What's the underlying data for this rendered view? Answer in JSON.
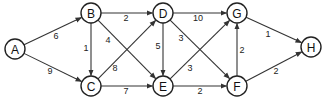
{
  "diagram": {
    "type": "weighted-directed-graph",
    "node_radius": 10,
    "colors": {
      "stroke": "#222222",
      "fill": "#ffffff",
      "text": "#111111"
    },
    "nodes": [
      {
        "id": "A",
        "label": "A",
        "x": 15,
        "y": 49
      },
      {
        "id": "B",
        "label": "B",
        "x": 91,
        "y": 13
      },
      {
        "id": "C",
        "label": "C",
        "x": 91,
        "y": 86
      },
      {
        "id": "D",
        "label": "D",
        "x": 163,
        "y": 13
      },
      {
        "id": "E",
        "label": "E",
        "x": 163,
        "y": 86
      },
      {
        "id": "G",
        "label": "G",
        "x": 237,
        "y": 13
      },
      {
        "id": "F",
        "label": "F",
        "x": 237,
        "y": 86
      },
      {
        "id": "H",
        "label": "H",
        "x": 311,
        "y": 47
      }
    ],
    "edges": [
      {
        "from": "A",
        "to": "B",
        "weight": "6",
        "lx": 56,
        "ly": 36
      },
      {
        "from": "A",
        "to": "C",
        "weight": "9",
        "lx": 50,
        "ly": 71
      },
      {
        "from": "B",
        "to": "D",
        "weight": "2",
        "lx": 126,
        "ly": 18
      },
      {
        "from": "B",
        "to": "C",
        "weight": "1",
        "lx": 86,
        "ly": 48
      },
      {
        "from": "B",
        "to": "E",
        "weight": "4",
        "lx": 108,
        "ly": 40
      },
      {
        "from": "C",
        "to": "D",
        "weight": "8",
        "lx": 115,
        "ly": 68
      },
      {
        "from": "C",
        "to": "E",
        "weight": "7",
        "lx": 126,
        "ly": 91
      },
      {
        "from": "D",
        "to": "E",
        "weight": "5",
        "lx": 158,
        "ly": 46
      },
      {
        "from": "D",
        "to": "G",
        "weight": "10",
        "lx": 198,
        "ly": 18
      },
      {
        "from": "D",
        "to": "F",
        "weight": "3",
        "lx": 181,
        "ly": 38
      },
      {
        "from": "E",
        "to": "G",
        "weight": "3",
        "lx": 190,
        "ly": 68
      },
      {
        "from": "E",
        "to": "F",
        "weight": "2",
        "lx": 200,
        "ly": 91
      },
      {
        "from": "F",
        "to": "G",
        "weight": "2",
        "lx": 242,
        "ly": 50
      },
      {
        "from": "G",
        "to": "H",
        "weight": "1",
        "lx": 268,
        "ly": 34
      },
      {
        "from": "F",
        "to": "H",
        "weight": "2",
        "lx": 276,
        "ly": 71
      }
    ]
  }
}
